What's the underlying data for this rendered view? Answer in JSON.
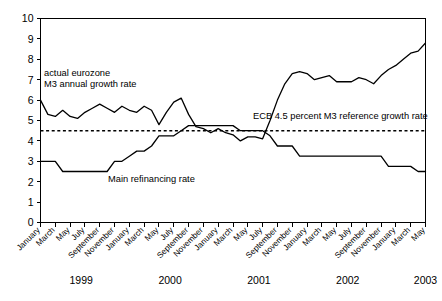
{
  "chart_data": {
    "type": "line",
    "title": "",
    "subtitle": "",
    "xlabel": "",
    "ylabel": "",
    "ylim": [
      0,
      10
    ],
    "ytick_values": [
      0,
      1,
      2,
      3,
      4,
      5,
      6,
      7,
      8,
      9,
      10
    ],
    "ytick_labels": [
      "0",
      "1",
      "2",
      "3",
      "4",
      "5",
      "6",
      "7",
      "8",
      "9",
      "10"
    ],
    "grid": false,
    "legend_position": "inline-annotations",
    "x_start": "1999-01",
    "x_end": "2003-06",
    "xtick_labels": [
      "January",
      "March",
      "May",
      "July",
      "September",
      "November",
      "January",
      "March",
      "May",
      "July",
      "September",
      "November",
      "January",
      "March",
      "May",
      "July",
      "September",
      "November",
      "January",
      "March",
      "May",
      "July",
      "September",
      "November",
      "January",
      "March",
      "May"
    ],
    "year_labels": [
      "1999",
      "2000",
      "2001",
      "2002",
      "2003"
    ],
    "annotations": [
      {
        "name": "m3-series-annotation",
        "lines": [
          "actual eurozone",
          "M3 annual growth rate"
        ],
        "x_px": 44,
        "y_px": 76
      },
      {
        "name": "reference-rate-annotation",
        "lines": [
          "ECB 4.5 percent M3 reference growth rate"
        ],
        "x_px": 253,
        "y_px": 119
      },
      {
        "name": "refi-series-annotation",
        "lines": [
          "Main refinancing rate"
        ],
        "x_px": 108,
        "y_px": 182
      }
    ],
    "series": [
      {
        "name": "actual eurozone M3 annual growth rate",
        "style": "solid",
        "color": "#000000",
        "values": [
          6.0,
          5.3,
          5.2,
          5.5,
          5.2,
          5.1,
          5.4,
          5.6,
          5.8,
          5.6,
          5.4,
          5.7,
          5.5,
          5.4,
          5.7,
          5.5,
          4.8,
          5.4,
          5.9,
          6.1,
          5.3,
          4.7,
          4.6,
          4.4,
          4.6,
          4.4,
          4.3,
          4.0,
          4.2,
          4.2,
          4.1,
          5.0,
          6.0,
          6.8,
          7.3,
          7.4,
          7.3,
          7.0,
          7.1,
          7.2,
          6.9,
          6.9,
          6.9,
          7.1,
          7.0,
          6.8,
          7.2,
          7.5,
          7.7,
          8.0,
          8.3,
          8.4,
          8.8
        ]
      },
      {
        "name": "Main refinancing rate",
        "style": "solid",
        "color": "#000000",
        "values": [
          3.0,
          3.0,
          3.0,
          2.5,
          2.5,
          2.5,
          2.5,
          2.5,
          2.5,
          2.5,
          3.0,
          3.0,
          3.25,
          3.5,
          3.5,
          3.75,
          4.25,
          4.25,
          4.25,
          4.5,
          4.75,
          4.75,
          4.75,
          4.75,
          4.75,
          4.75,
          4.75,
          4.5,
          4.5,
          4.5,
          4.5,
          4.25,
          3.75,
          3.75,
          3.75,
          3.25,
          3.25,
          3.25,
          3.25,
          3.25,
          3.25,
          3.25,
          3.25,
          3.25,
          3.25,
          3.25,
          3.25,
          2.75,
          2.75,
          2.75,
          2.75,
          2.5,
          2.5
        ]
      }
    ],
    "reference_line": {
      "name": "ECB 4.5 percent M3 reference growth rate",
      "value": 4.5,
      "style": "dotted",
      "color": "#000000"
    }
  }
}
